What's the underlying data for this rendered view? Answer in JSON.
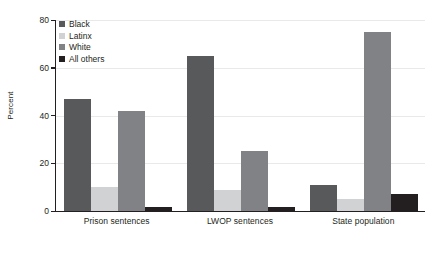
{
  "chart_data": {
    "type": "bar",
    "title": "",
    "subtitle": "",
    "xlabel": "",
    "ylabel": "Percent",
    "ylim": [
      0,
      80
    ],
    "yticks": [
      0,
      20,
      40,
      60,
      80
    ],
    "ytick_labels": [
      "0",
      "20",
      "40",
      "60",
      "80"
    ],
    "grid": true,
    "legend_position": "top-left",
    "categories": [
      "Prison sentences",
      "LWOP sentences",
      "State population"
    ],
    "series": [
      {
        "name": "Black",
        "color": "#58595b",
        "values": [
          47,
          65,
          11
        ]
      },
      {
        "name": "Latinx",
        "color": "#d0d2d3",
        "values": [
          10,
          9,
          5
        ]
      },
      {
        "name": "White",
        "color": "#808285",
        "values": [
          42,
          25,
          75
        ]
      },
      {
        "name": "All others",
        "color": "#231f20",
        "values": [
          1.5,
          1.5,
          7
        ]
      }
    ]
  },
  "legend": {
    "items": [
      {
        "label": "Black"
      },
      {
        "label": "Latinx"
      },
      {
        "label": "White"
      },
      {
        "label": "All others"
      }
    ]
  },
  "axes": {
    "y_title": "Percent",
    "y_tick_0": "0",
    "y_tick_1": "20",
    "y_tick_2": "40",
    "y_tick_3": "60",
    "y_tick_4": "80"
  },
  "x_axis": {
    "label_0": "Prison sentences",
    "label_1": "LWOP sentences",
    "label_2": "State population"
  },
  "colors": {
    "black_series": "#58595b",
    "latinx_series": "#d0d2d3",
    "white_series": "#808285",
    "all_others_series": "#231f20",
    "axis": "#231f20",
    "grid": "#e9e9ea",
    "background": "#ffffff"
  }
}
